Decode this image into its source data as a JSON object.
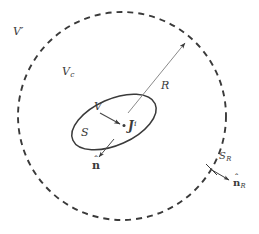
{
  "figure": {
    "background_color": "#ffffff",
    "line_color": "#3a3a3a",
    "labels": {
      "exterior_region": {
        "symbol": "V",
        "prime": "′",
        "name": "V-prime"
      },
      "intermediate_region": {
        "symbol": "V",
        "subscript": "c",
        "name": "V-c"
      },
      "source_volume": {
        "symbol": "V",
        "name": "V"
      },
      "source_surface": {
        "symbol": "S",
        "name": "S"
      },
      "current_density": {
        "symbol": "J",
        "superscript": "i",
        "name": "J-impressed"
      },
      "radius": {
        "symbol": "R",
        "name": "R"
      },
      "sphere_surface": {
        "symbol": "S",
        "subscript": "R",
        "name": "S-R"
      },
      "normal_source": {
        "base": "n",
        "accent": "ˆ",
        "name": "n-hat"
      },
      "normal_sphere": {
        "base": "n",
        "accent": "ˆ",
        "subscript": "R",
        "name": "n-hat-R"
      }
    },
    "shapes": {
      "dashed_circle": {
        "center_x": 122,
        "center_y": 116,
        "radius": 104,
        "style": "dashed"
      },
      "source_ellipse": {
        "center_x": 114,
        "center_y": 122,
        "rx": 45,
        "ry": 23,
        "rotation_deg": -24,
        "style": "solid"
      },
      "radius_line": {
        "from_x": 128,
        "from_y": 113,
        "to_x": 188,
        "to_y": 39,
        "arrow": "end"
      },
      "current_arrow": {
        "from_x": 100,
        "from_y": 114,
        "to_x": 124,
        "to_y": 125,
        "arrow": "end"
      },
      "normal_source_arrow": {
        "from_x": 113,
        "from_y": 140,
        "to_x": 98,
        "to_y": 159,
        "arrow": "end"
      },
      "normal_sphere_arrow": {
        "from_x": 213,
        "from_y": 170,
        "to_x": 232,
        "to_y": 181,
        "arrow": "end"
      },
      "tick_sphere": {
        "x1": 207,
        "y1": 165,
        "x2": 218,
        "y2": 176
      }
    }
  }
}
